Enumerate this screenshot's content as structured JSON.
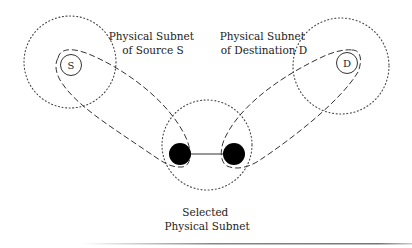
{
  "labels": {
    "source_subnet_line1": "Physical Subnet",
    "source_subnet_line2": "of Source S",
    "dest_subnet_line1": "Physical Subnet",
    "dest_subnet_line2": "of Destination D",
    "selected_line1": "Selected",
    "selected_line2": "Physical Subnet",
    "source_node": "S",
    "dest_node": "D"
  },
  "colors": {
    "stroke": "#333333",
    "node_fill": "#000000",
    "text": "#222222"
  }
}
